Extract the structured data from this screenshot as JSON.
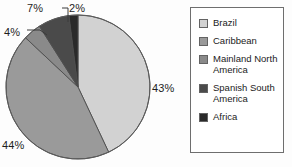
{
  "chart_data": {
    "type": "pie",
    "title": "",
    "categories": [
      "Brazil",
      "Caribbean",
      "Mainland North America",
      "Spanish South America",
      "Africa"
    ],
    "values": [
      43,
      44,
      4,
      7,
      2
    ],
    "value_labels": [
      "43%",
      "44%",
      "4%",
      "7%",
      "2%"
    ],
    "unit": "%",
    "colors": [
      "#d2d2d2",
      "#9a9a9a",
      "#8a8a8a",
      "#4a4a4a",
      "#2a2a2a"
    ],
    "legend_position": "right",
    "grid": false,
    "start_angle_deg": 0,
    "direction": "clockwise",
    "slices": [
      {
        "label": "Brazil",
        "value": 43,
        "display": "43%",
        "color": "#d2d2d2",
        "start_deg": 0,
        "end_deg": 154.8
      },
      {
        "label": "Caribbean",
        "value": 44,
        "display": "44%",
        "color": "#9a9a9a",
        "start_deg": 154.8,
        "end_deg": 313.2
      },
      {
        "label": "Mainland North America",
        "value": 4,
        "display": "4%",
        "color": "#8a8a8a",
        "start_deg": 313.2,
        "end_deg": 327.6
      },
      {
        "label": "Spanish South America",
        "value": 7,
        "display": "7%",
        "color": "#4a4a4a",
        "start_deg": 327.6,
        "end_deg": 352.8
      },
      {
        "label": "Africa",
        "value": 2,
        "display": "2%",
        "color": "#2a2a2a",
        "start_deg": 352.8,
        "end_deg": 360
      }
    ]
  },
  "labels": {
    "brazil_pct": "43%",
    "caribbean_pct": "44%",
    "mainland_pct": "4%",
    "spanish_pct": "7%",
    "africa_pct": "2%"
  },
  "legend": {
    "items": [
      {
        "label": "Brazil",
        "color": "#d2d2d2"
      },
      {
        "label": "Caribbean",
        "color": "#9a9a9a"
      },
      {
        "label": "Mainland North America",
        "color": "#8a8a8a"
      },
      {
        "label": "Spanish South America",
        "color": "#4a4a4a"
      },
      {
        "label": "Africa",
        "color": "#2a2a2a"
      }
    ]
  }
}
